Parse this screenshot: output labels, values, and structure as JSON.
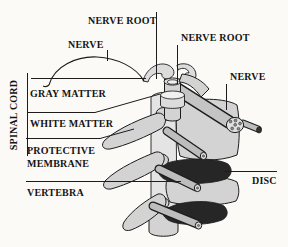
{
  "figure": {
    "colors": {
      "paper": "#fbfaf7",
      "ink": "#1c1c1c",
      "text": "#141414",
      "bone": "#d3d3d3",
      "boneL": "#e4e4e4",
      "cuff": "#dcdcdc",
      "ring": "#f0f0f0",
      "tube": "#bdbdbd",
      "tubeBig": "#c4c4c4",
      "cut": "#dfdfdf",
      "dot": "#8f8f8f",
      "disc": "#262626",
      "cap": "#333333"
    }
  },
  "labels": {
    "nerve_root_top": "NERVE ROOT",
    "nerve_left": "NERVE",
    "nerve_root_right": "NERVE ROOT",
    "nerve_right": "NERVE",
    "spinal_cord": "SPINAL CORD",
    "gray_matter": "GRAY MATTER",
    "white_matter": "WHITE MATTER",
    "protective_membrane_line1": "PROTECTIVE",
    "protective_membrane_line2": "MEMBRANE",
    "vertebra": "VERTEBRA",
    "disc": "DISC"
  }
}
